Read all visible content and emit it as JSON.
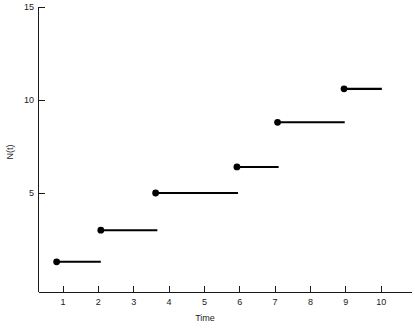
{
  "chart_data": {
    "type": "line",
    "title": "",
    "subtitle": "",
    "xlabel": "Time",
    "ylabel": "N(t)",
    "xlim": [
      0,
      11.0
    ],
    "ylim": [
      0,
      15
    ],
    "grid": false,
    "legend": "none",
    "x_ticks": [
      1,
      2,
      3,
      4,
      5,
      6,
      7,
      8,
      9,
      10
    ],
    "x_tick_labels": [
      "1",
      "2",
      "3",
      "4",
      "5",
      "6",
      "7",
      "8",
      "9",
      "10"
    ],
    "y_ticks": [
      5,
      10,
      15
    ],
    "y_tick_labels": [
      "5",
      "10",
      "15"
    ],
    "series": [
      {
        "name": "N(t)",
        "style": "step-post-with-open-dot",
        "color": "#000000",
        "steps": [
          {
            "x_start": 0.82,
            "x_end": 2.07,
            "y": 1.3
          },
          {
            "x_start": 2.07,
            "x_end": 3.67,
            "y": 3.0
          },
          {
            "x_start": 3.62,
            "x_end": 5.95,
            "y": 5.0
          },
          {
            "x_start": 5.92,
            "x_end": 7.1,
            "y": 6.4
          },
          {
            "x_start": 7.07,
            "x_end": 8.97,
            "y": 8.8
          },
          {
            "x_start": 8.95,
            "x_end": 10.02,
            "y": 10.6
          }
        ],
        "jump_times": [
          0.82,
          2.07,
          3.62,
          5.92,
          7.07,
          8.95
        ],
        "jump_values": [
          1.3,
          3.0,
          5.0,
          6.4,
          8.8,
          10.6
        ]
      }
    ]
  },
  "axes": {
    "x_axis_name": "Time",
    "y_axis_name": "N(t)"
  }
}
